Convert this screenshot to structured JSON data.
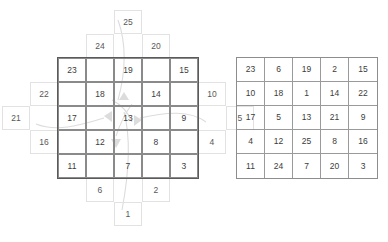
{
  "figure": {
    "type": "magic-square-construction",
    "title": "",
    "size": 5
  },
  "diagram": {
    "name": "staircase-construction",
    "inner_grid": {
      "rows": [
        [
          "23",
          "",
          "19",
          "",
          "15"
        ],
        [
          "",
          "18",
          "",
          "14",
          ""
        ],
        [
          "17",
          "",
          "13",
          "",
          "9"
        ],
        [
          "",
          "12",
          "",
          "8",
          ""
        ],
        [
          "11",
          "",
          "7",
          "",
          "3"
        ]
      ]
    },
    "outer_cells": [
      {
        "label": "25",
        "side": "top",
        "offset": 0
      },
      {
        "label": "24",
        "side": "top",
        "offset": -1
      },
      {
        "label": "20",
        "side": "top",
        "offset": 1
      },
      {
        "label": "22",
        "side": "left",
        "offset": -1
      },
      {
        "label": "21",
        "side": "left",
        "offset": 0
      },
      {
        "label": "16",
        "side": "left",
        "offset": 1
      },
      {
        "label": "10",
        "side": "right",
        "offset": -1
      },
      {
        "label": "5",
        "side": "right",
        "offset": 0
      },
      {
        "label": "4",
        "side": "right",
        "offset": 1
      },
      {
        "label": "6",
        "side": "bottom",
        "offset": -1
      },
      {
        "label": "2",
        "side": "bottom",
        "offset": 1
      },
      {
        "label": "1",
        "side": "bottom",
        "offset": 0
      }
    ]
  },
  "result": {
    "name": "magic-square",
    "rows": [
      [
        "23",
        "6",
        "19",
        "2",
        "15"
      ],
      [
        "10",
        "18",
        "1",
        "14",
        "22"
      ],
      [
        "17",
        "5",
        "13",
        "21",
        "9"
      ],
      [
        "4",
        "12",
        "25",
        "8",
        "16"
      ],
      [
        "11",
        "24",
        "7",
        "20",
        "3"
      ]
    ]
  },
  "chart_data": {
    "type": "table",
    "left_panel": {
      "description": "Diagonal staircase layout with overflow cells outside the 5x5 border",
      "inner_values": [
        [
          "23",
          "",
          "19",
          "",
          "15"
        ],
        [
          "",
          "18",
          "",
          "14",
          ""
        ],
        [
          "17",
          "",
          "13",
          "",
          "9"
        ],
        [
          "",
          "12",
          "",
          "8",
          ""
        ],
        [
          "11",
          "",
          "7",
          "",
          "3"
        ]
      ],
      "outer_values": [
        "25",
        "24",
        "20",
        "22",
        "21",
        "16",
        "10",
        "5",
        "4",
        "6",
        "2",
        "1"
      ]
    },
    "right_panel": {
      "description": "Completed 5x5 magic square",
      "values": [
        [
          23,
          6,
          19,
          2,
          15
        ],
        [
          10,
          18,
          1,
          14,
          22
        ],
        [
          17,
          5,
          13,
          21,
          9
        ],
        [
          4,
          12,
          25,
          8,
          16
        ],
        [
          11,
          24,
          7,
          20,
          3
        ]
      ],
      "magic_constant": 65
    },
    "colors": {
      "inner_border": "#8a8a8a",
      "outer_border": "#e2e2e2",
      "text": "#3c3c3c",
      "arrow": "#d8d8d8",
      "background": "#ffffff"
    }
  }
}
